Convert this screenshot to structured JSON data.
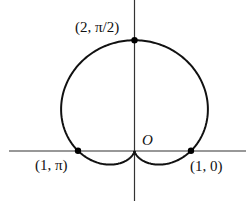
{
  "figure": {
    "type": "polar-curve",
    "equation": "r = 1 + sin θ",
    "curve_name": "cardioid",
    "colors": {
      "curve": "#111111",
      "axes": "#333333",
      "points": "#000000",
      "background": "#ffffff"
    }
  },
  "chart_data": {
    "type": "line",
    "title": "",
    "coordinate_system": "polar",
    "equation": "r = 1 + sin(theta)",
    "origin_label": "O",
    "marked_points": [
      {
        "label": "(2, π/2)",
        "r": 2,
        "theta": "π/2",
        "x": 0,
        "y": 2
      },
      {
        "label": "(1, π)",
        "r": 1,
        "theta": "π",
        "x": -1,
        "y": 0
      },
      {
        "label": "(1, 0)",
        "r": 1,
        "theta": "0",
        "x": 1,
        "y": 0
      }
    ],
    "xlim": [
      -2.25,
      2.0
    ],
    "ylim": [
      -0.9,
      2.7
    ],
    "grid": false,
    "legend": null
  },
  "labels": {
    "top_point": "(2, π/2)",
    "left_point": "(1, π)",
    "right_point": "(1, 0)",
    "origin": "O"
  }
}
